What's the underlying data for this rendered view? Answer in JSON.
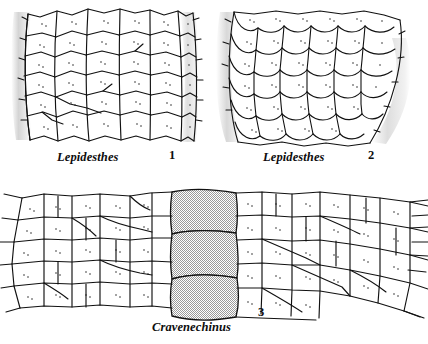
{
  "figure": {
    "background_color": "#ffffff",
    "ink_color": "#111111",
    "shade_color": "#d9d9d9",
    "panels": [
      {
        "id": "panel-1",
        "number": "1",
        "taxon": "Lepidesthes",
        "pattern": "polygonal imbricating plates",
        "shaded_plates": 0
      },
      {
        "id": "panel-2",
        "number": "2",
        "taxon": "Lepidesthes",
        "pattern": "imbricate scale-like plates",
        "shaded_plates": 0
      },
      {
        "id": "panel-3",
        "number": "3",
        "taxon": "Cravenechinus",
        "pattern": "elongate plates in horizontal series",
        "shaded_plates": 3
      }
    ]
  }
}
